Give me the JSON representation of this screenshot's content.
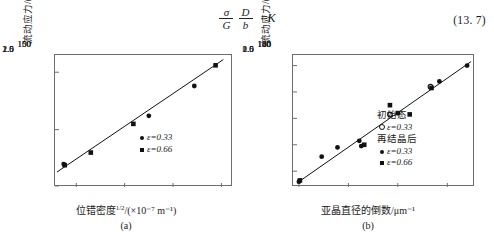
{
  "equation": {
    "numerator_1": "σ",
    "denominator_1": "G",
    "numerator_2": "D",
    "denominator_2": "b",
    "equals": "=",
    "result": "K",
    "number": "(13. 7)"
  },
  "figures": [
    {
      "id": "a",
      "panel_label": "(a)",
      "yaxis_title": "流动应力/(MN·m⁻²)",
      "xaxis_title_main": "位错密度",
      "xaxis_title_sup": "1/2",
      "xaxis_title_rest": "/(×10⁻⁷ m⁻¹)",
      "xaxis_title_full": "位错密度1/2/(×10⁻⁷ m⁻¹)",
      "yticks": [
        "150",
        "100",
        "50"
      ],
      "xticks": [
        "1.0",
        "1.5",
        "2.0",
        "2.5"
      ],
      "legend": [
        {
          "marker": "filled-circle",
          "label": "ε=0.33"
        },
        {
          "marker": "filled-square",
          "label": "ε=0.66"
        }
      ]
    },
    {
      "id": "b",
      "panel_label": "(b)",
      "yaxis_title": "流动应力/(MN·m⁻²)",
      "xaxis_title_full": "亚晶直径的倒数/μm⁻¹",
      "yticks": [
        "140",
        "120",
        "100",
        "80",
        "60"
      ],
      "xticks": [
        "0.5",
        "1.0",
        "1.5",
        "2.0"
      ],
      "legend_groups": [
        {
          "heading": "初始态",
          "entries": [
            {
              "marker": "open-circle",
              "label": "ε=0.33"
            }
          ]
        },
        {
          "heading": "再结晶后",
          "entries": [
            {
              "marker": "filled-circle",
              "label": "ε=0.33"
            },
            {
              "marker": "filled-square",
              "label": "ε=0.66"
            }
          ]
        }
      ]
    }
  ],
  "chart_data": [
    {
      "type": "scatter",
      "title": "(a)",
      "xlabel": "位错密度1/2/(×10⁻⁷ m⁻¹)",
      "ylabel": "流动应力/(MN·m⁻²)",
      "xlim": [
        0.78,
        2.62
      ],
      "ylim": [
        50,
        165
      ],
      "xticks": [
        1.0,
        1.5,
        2.0,
        2.5
      ],
      "yticks": [
        50,
        100,
        150
      ],
      "grid": false,
      "legend_position": "lower-right",
      "series": [
        {
          "name": "ε=0.33",
          "marker": "filled-circle",
          "points": [
            {
              "x": 0.87,
              "y": 70
            },
            {
              "x": 1.75,
              "y": 112
            },
            {
              "x": 2.22,
              "y": 138
            }
          ]
        },
        {
          "name": "ε=0.66",
          "marker": "filled-square",
          "points": [
            {
              "x": 0.88,
              "y": 69
            },
            {
              "x": 1.15,
              "y": 80
            },
            {
              "x": 1.59,
              "y": 105
            },
            {
              "x": 2.44,
              "y": 156
            }
          ]
        }
      ],
      "fit_line": {
        "x1": 0.8,
        "y1": 63,
        "x2": 2.52,
        "y2": 161
      }
    },
    {
      "type": "scatter",
      "title": "(b)",
      "xlabel": "亚晶直径的倒数/μm⁻¹",
      "ylabel": "流动应力/(MN·m⁻²)",
      "xlim": [
        0.44,
        2.28
      ],
      "ylim": [
        48,
        148
      ],
      "xticks": [
        0.5,
        1.0,
        1.5,
        2.0
      ],
      "yticks": [
        60,
        80,
        100,
        120,
        140
      ],
      "grid": false,
      "legend_position": "lower-right",
      "series": [
        {
          "name": "初始态 ε=0.33",
          "marker": "open-circle",
          "points": [
            {
              "x": 1.42,
              "y": 103
            },
            {
              "x": 1.83,
              "y": 124
            }
          ]
        },
        {
          "name": "再结晶后 ε=0.33",
          "marker": "filled-circle",
          "points": [
            {
              "x": 0.5,
              "y": 52
            },
            {
              "x": 0.73,
              "y": 71
            },
            {
              "x": 0.89,
              "y": 78
            },
            {
              "x": 1.11,
              "y": 83
            },
            {
              "x": 1.13,
              "y": 79
            },
            {
              "x": 1.92,
              "y": 128
            },
            {
              "x": 2.2,
              "y": 140
            }
          ]
        },
        {
          "name": "再结晶后 ε=0.66",
          "marker": "filled-square",
          "points": [
            {
              "x": 0.51,
              "y": 53
            },
            {
              "x": 1.16,
              "y": 80
            },
            {
              "x": 1.42,
              "y": 110
            },
            {
              "x": 1.5,
              "y": 104
            },
            {
              "x": 1.62,
              "y": 103
            },
            {
              "x": 1.84,
              "y": 123
            }
          ]
        }
      ],
      "fit_line": {
        "x1": 0.48,
        "y1": 51,
        "x2": 2.24,
        "y2": 143
      }
    }
  ]
}
